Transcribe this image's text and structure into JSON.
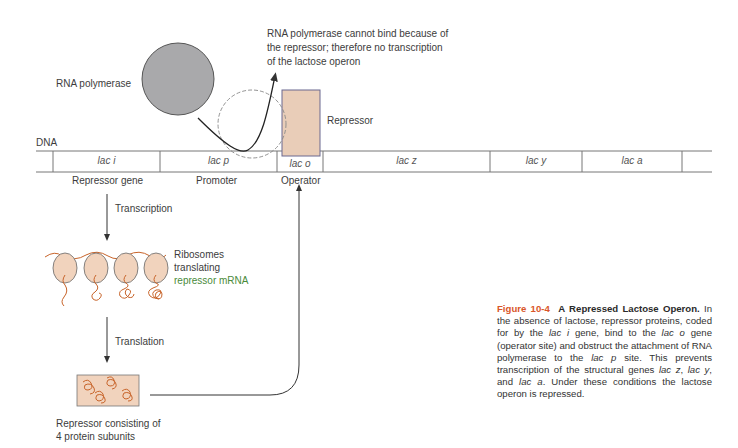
{
  "figure": {
    "annotation_top": [
      "RNA polymerase cannot bind because of",
      "the repressor; therefore no transcription",
      "of the lactose operon"
    ],
    "rna_polymerase_label": "RNA polymerase",
    "repressor_label": "Repressor",
    "dna_label": "DNA",
    "genes": [
      {
        "name": "lac i",
        "sub_label": "Repressor gene"
      },
      {
        "name": "lac p",
        "sub_label": "Promoter"
      },
      {
        "name": "lac o",
        "sub_label": "Operator"
      },
      {
        "name": "lac z",
        "sub_label": ""
      },
      {
        "name": "lac y",
        "sub_label": ""
      },
      {
        "name": "lac a",
        "sub_label": ""
      }
    ],
    "transcription_label": "Transcription",
    "ribosome_label": [
      "Ribosomes",
      "translating",
      "repressor mRNA"
    ],
    "translation_label": "Translation",
    "repressor_complex_label": [
      "Repressor consisting of",
      "4 protein subunits"
    ]
  },
  "caption": {
    "figure_number": "Figure 10-4",
    "title": "A Repressed Lactose Operon.",
    "text_1": " In the absence of lactose, repressor proteins, coded for by the ",
    "gene_i": "lac i",
    "text_2": " gene, bind to the ",
    "gene_o": "lac o",
    "text_3": " gene (operator site) and obstruct the attachment of RNA polymerase to the ",
    "gene_p": "lac p",
    "text_4": " site. This prevents transcription of the structural genes ",
    "gene_z": "lac z",
    "sep_1": ", ",
    "gene_y": "lac y",
    "sep_2": ", and ",
    "gene_a": "lac a",
    "text_5": ". Under these conditions the lactose operon is repressed."
  },
  "colors": {
    "polymerase_fill": "#a9a9ab",
    "repressor_fill": "#e9cdb8",
    "repressor_border": "#6a6890",
    "ribosome_fill": "#f1d3bd",
    "protein_strand": "#c8642a",
    "caption_accent": "#d9562a",
    "green_text": "#4a8a3a"
  }
}
